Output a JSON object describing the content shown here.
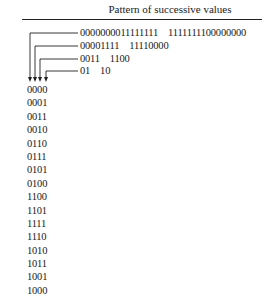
{
  "table": {
    "title": "Pattern of successive values"
  },
  "patterns": [
    {
      "first_half": "0000000011111111",
      "second_half": "1111111100000000"
    },
    {
      "first_half": "00001111",
      "second_half": "11110000"
    },
    {
      "first_half": "0011",
      "second_half": "1100"
    },
    {
      "first_half": "01",
      "second_half": "10"
    }
  ],
  "sequence": [
    "0000",
    "0001",
    "0011",
    "0010",
    "0110",
    "0111",
    "0101",
    "0100",
    "1100",
    "1101",
    "1111",
    "1110",
    "1010",
    "1011",
    "1001",
    "1000"
  ],
  "colors": {
    "text": "#1a1a1a",
    "lines": "#222222",
    "background": "#ffffff"
  }
}
